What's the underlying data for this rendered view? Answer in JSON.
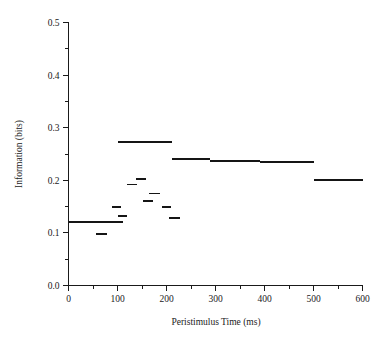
{
  "chart_data": {
    "type": "line",
    "title": "",
    "xlabel": "Peristimulus Time (ms)",
    "ylabel": "Information (bits)",
    "xlim": [
      0,
      600
    ],
    "ylim": [
      0.0,
      0.5
    ],
    "grid": false,
    "legend": "none",
    "xticks": [
      0,
      100,
      200,
      300,
      400,
      500,
      600
    ],
    "xtick_labels": [
      "0",
      "100",
      "200",
      "300",
      "400",
      "500",
      "600"
    ],
    "xminor_ticks": [
      50,
      150,
      250,
      350,
      450,
      550
    ],
    "yticks": [
      0.0,
      0.1,
      0.2,
      0.3,
      0.4,
      0.5
    ],
    "ytick_labels": [
      "0.0",
      "0.1",
      "0.2",
      "0.3",
      "0.4",
      "0.5"
    ],
    "yminor_ticks": [
      0.05,
      0.15,
      0.25,
      0.35,
      0.45
    ],
    "series": [
      {
        "name": "Information",
        "style": "horizontal-segments",
        "color": "#151515",
        "segments": [
          {
            "x_start": 0,
            "x_end": 112,
            "y": 0.12
          },
          {
            "x_start": 42,
            "x_end": 62,
            "y": 0.0
          },
          {
            "x_start": 56,
            "x_end": 78,
            "y": 0.098
          },
          {
            "x_start": 88,
            "x_end": 108,
            "y": 0.15
          },
          {
            "x_start": 100,
            "x_end": 120,
            "y": 0.132
          },
          {
            "x_start": 100,
            "x_end": 212,
            "y": 0.272
          },
          {
            "x_start": 120,
            "x_end": 140,
            "y": 0.192
          },
          {
            "x_start": 138,
            "x_end": 158,
            "y": 0.202
          },
          {
            "x_start": 152,
            "x_end": 172,
            "y": 0.16
          },
          {
            "x_start": 164,
            "x_end": 186,
            "y": 0.175
          },
          {
            "x_start": 190,
            "x_end": 210,
            "y": 0.15
          },
          {
            "x_start": 206,
            "x_end": 228,
            "y": 0.128
          },
          {
            "x_start": 212,
            "x_end": 288,
            "y": 0.24
          },
          {
            "x_start": 288,
            "x_end": 390,
            "y": 0.236
          },
          {
            "x_start": 390,
            "x_end": 500,
            "y": 0.235
          },
          {
            "x_start": 500,
            "x_end": 600,
            "y": 0.2
          }
        ]
      }
    ]
  }
}
